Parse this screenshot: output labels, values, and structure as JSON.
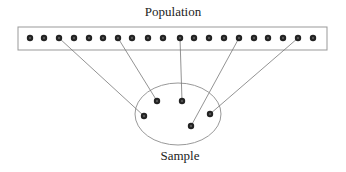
{
  "title": "Population",
  "sample_label": "Sample",
  "colors": {
    "dot": "#222222",
    "line": "#777777",
    "box": "#999999"
  },
  "population": {
    "box": {
      "x": 18,
      "y": 27,
      "w": 309,
      "h": 23
    },
    "dot_y": 38,
    "dots_x": [
      30,
      44,
      59,
      74,
      89,
      103,
      118,
      132,
      148,
      163,
      180,
      194,
      209,
      224,
      239,
      254,
      268,
      283,
      298,
      313
    ]
  },
  "sample": {
    "ellipse": {
      "cx": 178,
      "cy": 114,
      "rx": 43,
      "ry": 31
    },
    "dots": [
      [
        157,
        101
      ],
      [
        182,
        101
      ],
      [
        144,
        116
      ],
      [
        210,
        114
      ],
      [
        191,
        126
      ]
    ]
  },
  "links": [
    {
      "from_index": 2,
      "to": [
        144,
        116
      ]
    },
    {
      "from_index": 6,
      "to": [
        157,
        101
      ]
    },
    {
      "from_index": 10,
      "to": [
        182,
        101
      ]
    },
    {
      "from_index": 14,
      "to": [
        191,
        126
      ]
    },
    {
      "from_index": 18,
      "to": [
        210,
        114
      ]
    }
  ]
}
